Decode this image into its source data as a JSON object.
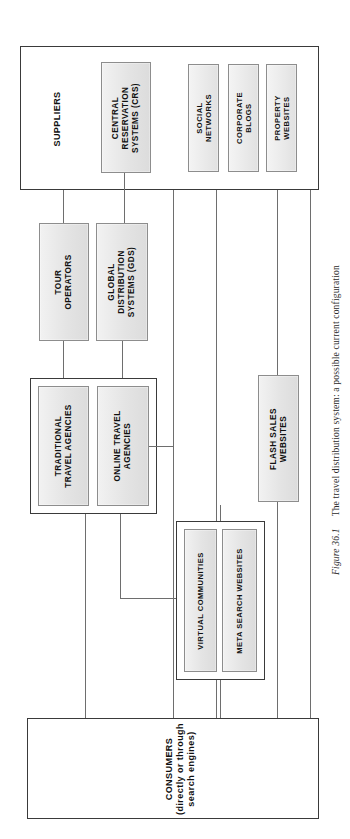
{
  "figure": {
    "number": "Figure 36.1",
    "caption": "The travel distribution system: a possible current configuration"
  },
  "diagram": {
    "type": "flowchart",
    "orientation": "rotated-90",
    "tiers": [
      {
        "id": "suppliers",
        "label": "SUPPLIERS",
        "nodes": [
          "CENTRAL RESERVATION SYSTEMS (CRS)",
          "SOCIAL NETWORKS",
          "CORPORATE BLOGS",
          "PROPERTY WEBSITES"
        ]
      },
      {
        "id": "intermediaries",
        "label": "",
        "nodes": [
          "TOUR OPERATORS",
          "GLOBAL DISTRIBUTION SYSTEMS (GDS)"
        ]
      },
      {
        "id": "agencies",
        "label": "",
        "nodes": [
          "TRADITIONAL TRAVEL AGENCIES",
          "ONLINE TRAVEL AGENCIES"
        ]
      },
      {
        "id": "web-channels",
        "label": "",
        "nodes": [
          "FLASH SALES WEBSITES",
          "VIRTUAL COMMUNITIES",
          "META SEARCH WEBSITES"
        ]
      },
      {
        "id": "consumers",
        "label": "CONSUMERS (directly or through search engines)",
        "nodes": []
      }
    ],
    "boxes": {
      "suppliers_group": "SUPPLIERS",
      "crs": "CENTRAL\nRESERVATION\nSYSTEMS (CRS)",
      "crs_l1": "CENTRAL",
      "crs_l2": "RESERVATION",
      "crs_l3": "SYSTEMS (CRS)",
      "social_l1": "SOCIAL",
      "social_l2": "NETWORKS",
      "blogs_l1": "CORPORATE",
      "blogs_l2": "BLOGS",
      "property_l1": "PROPERTY",
      "property_l2": "WEBSITES",
      "tour_l1": "TOUR",
      "tour_l2": "OPERATORS",
      "gds_l1": "GLOBAL",
      "gds_l2": "DISTRIBUTION",
      "gds_l3": "SYSTEMS (GDS)",
      "trad_l1": "TRADITIONAL",
      "trad_l2": "TRAVEL AGENCIES",
      "ota_l1": "ONLINE TRAVEL",
      "ota_l2": "AGENCIES",
      "flash_l1": "FLASH SALES",
      "flash_l2": "WEBSITES",
      "virtual": "VIRTUAL COMMUNITIES",
      "meta": "META SEARCH WEBSITES",
      "consumers_l1": "CONSUMERS",
      "consumers_l2": "(directly or through",
      "consumers_l3": "search engines)"
    },
    "colors": {
      "node_fill": "#e8e8e8",
      "node_border": "#8d8d8d",
      "group_border": "#3a3a3a",
      "connector": "#6e6e6e",
      "background": "#ffffff"
    }
  }
}
